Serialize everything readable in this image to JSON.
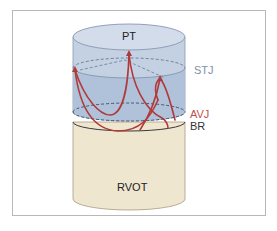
{
  "figure": {
    "labels": {
      "pt": "PT",
      "stj": "STJ",
      "avj": "AVJ",
      "br": "BR",
      "rvot": "RVOT"
    },
    "colors": {
      "frame": "#b8b8b8",
      "upper_cylinder": "#b9c9dd",
      "upper_cylinder_top": "#cfd9e6",
      "sinus_region": "#a9bcd6",
      "lower_cylinder": "#efe6cf",
      "cusp_line": "#b03a3a",
      "stj_label": "#7f90a8",
      "avj_label": "#c0504d",
      "br_label": "#333333",
      "text": "#222222"
    }
  }
}
